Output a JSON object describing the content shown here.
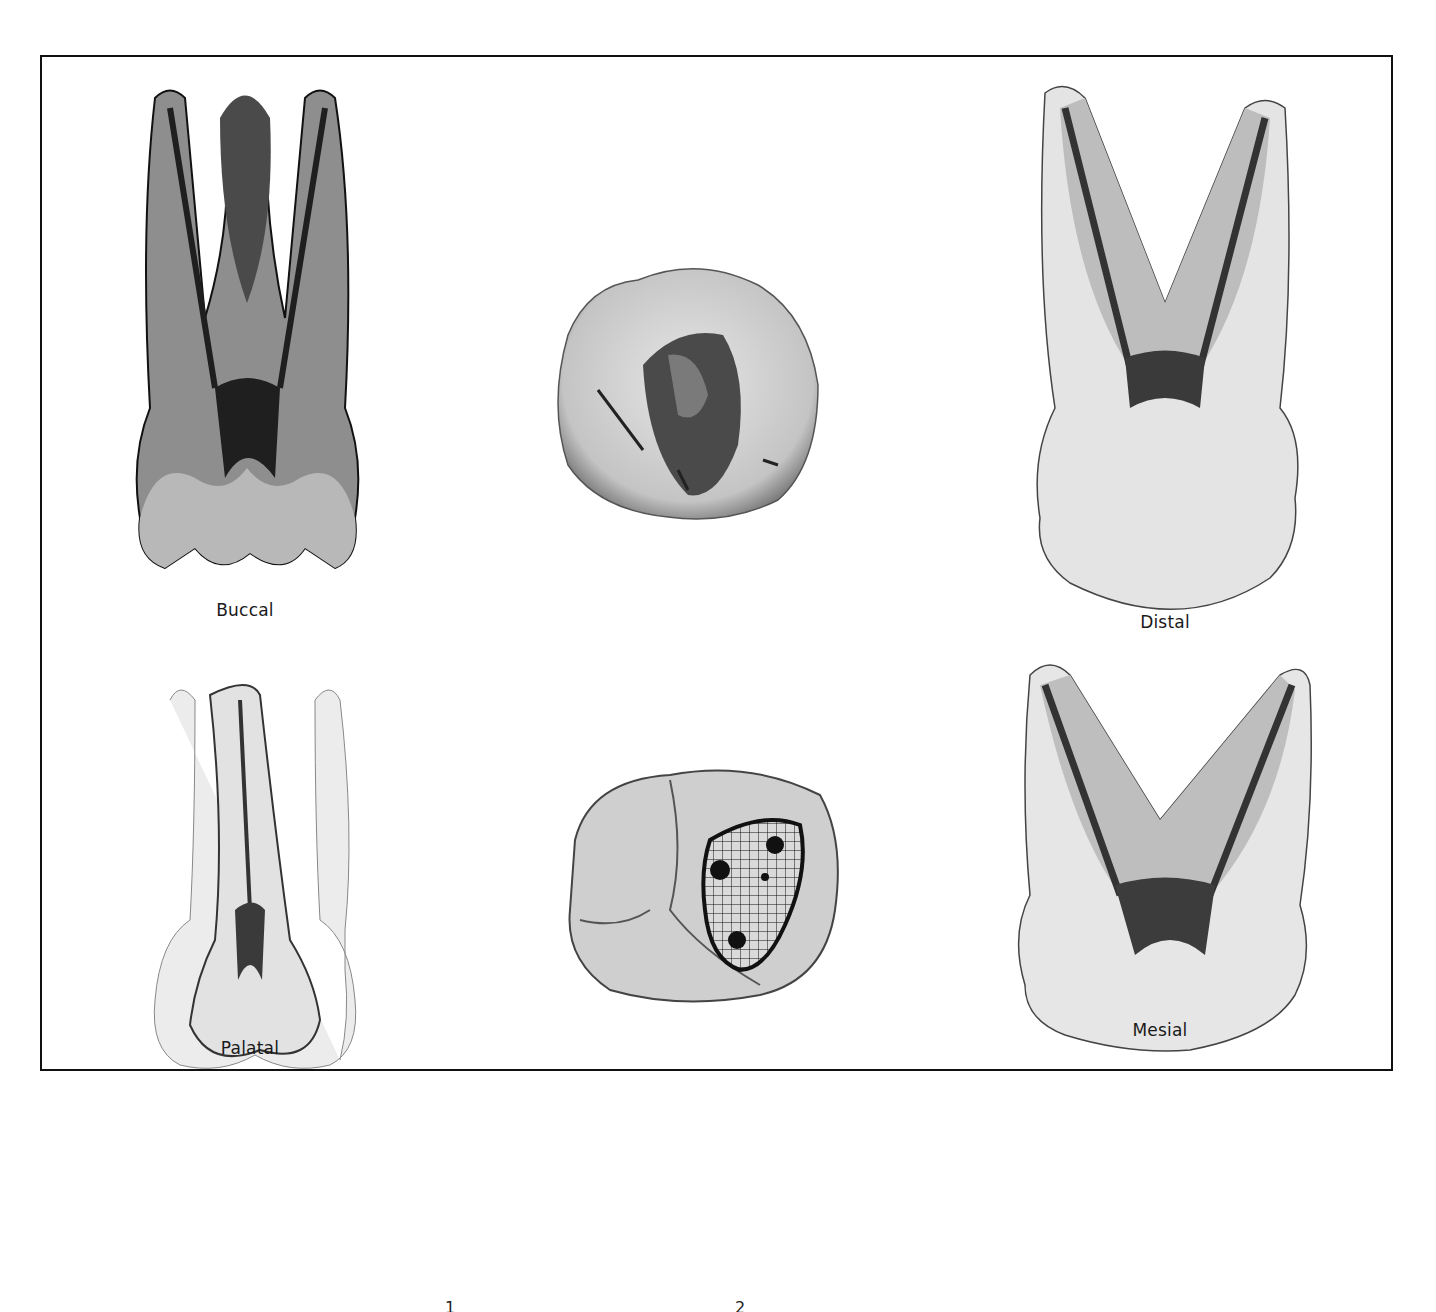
{
  "figure": {
    "views": [
      {
        "id": "buccal",
        "label": "Buccal"
      },
      {
        "id": "distal",
        "label": "Distal"
      },
      {
        "id": "palatal",
        "label": "Palatal"
      },
      {
        "id": "mesial",
        "label": "Mesial"
      }
    ],
    "center_top": {
      "description": "occlusal photograph of access cavity"
    },
    "center_bottom": {
      "description": "occlusal drawing with gridded access outline and canal orifices"
    },
    "below_frame_fragments": [
      "1",
      "2"
    ]
  },
  "colors": {
    "frame": "#111111",
    "enamel": "#dcdcdc",
    "dentin": "#9a9a9a",
    "pulp": "#2e2e2e",
    "background": "#ffffff"
  }
}
